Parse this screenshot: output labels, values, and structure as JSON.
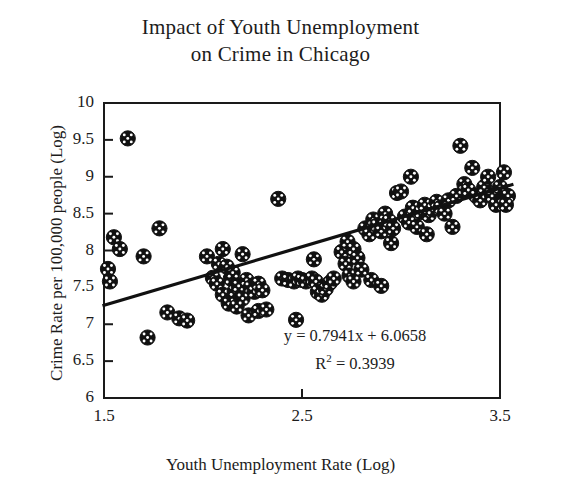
{
  "chart_data": {
    "type": "scatter",
    "title": "Impact of Youth Unemployment\non Crime in Chicago",
    "title_line1": "Impact of Youth Unemployment",
    "title_line2": "on Crime in Chicago",
    "xlabel": "Youth Unemployment Rate (Log)",
    "ylabel": "Crime Rate per 100,000 people (Log)",
    "xlim": [
      1.5,
      3.5
    ],
    "ylim": [
      6,
      10
    ],
    "xticks": [
      1.5,
      2.5,
      3.5
    ],
    "xtick_labels": [
      "1.5",
      "2.5",
      "3.5"
    ],
    "yticks": [
      6,
      6.5,
      7,
      7.5,
      8,
      8.5,
      9,
      9.5,
      10
    ],
    "ytick_labels": [
      "6",
      "6.5",
      "7",
      "7.5",
      "8",
      "8.5",
      "9",
      "9.5",
      "10"
    ],
    "grid": false,
    "legend": null,
    "marker": "circle-with-white-cross-speckle",
    "marker_color": "#111111",
    "series": [
      {
        "name": "Chicago community areas",
        "points": [
          [
            1.52,
            7.75
          ],
          [
            1.55,
            8.18
          ],
          [
            1.58,
            8.02
          ],
          [
            1.53,
            7.58
          ],
          [
            1.62,
            9.52
          ],
          [
            1.7,
            7.92
          ],
          [
            1.72,
            6.82
          ],
          [
            1.78,
            8.3
          ],
          [
            1.82,
            7.16
          ],
          [
            1.88,
            7.08
          ],
          [
            1.92,
            7.05
          ],
          [
            2.02,
            7.92
          ],
          [
            2.05,
            7.63
          ],
          [
            2.07,
            7.55
          ],
          [
            2.1,
            7.4
          ],
          [
            2.08,
            7.82
          ],
          [
            2.12,
            7.78
          ],
          [
            2.1,
            8.02
          ],
          [
            2.14,
            7.62
          ],
          [
            2.16,
            7.45
          ],
          [
            2.15,
            7.7
          ],
          [
            2.18,
            7.52
          ],
          [
            2.2,
            7.35
          ],
          [
            2.13,
            7.28
          ],
          [
            2.17,
            7.24
          ],
          [
            2.22,
            7.6
          ],
          [
            2.24,
            7.5
          ],
          [
            2.26,
            7.44
          ],
          [
            2.2,
            7.95
          ],
          [
            2.28,
            7.55
          ],
          [
            2.23,
            7.12
          ],
          [
            2.28,
            7.18
          ],
          [
            2.32,
            7.2
          ],
          [
            2.3,
            7.46
          ],
          [
            2.38,
            8.7
          ],
          [
            2.4,
            7.62
          ],
          [
            2.43,
            7.6
          ],
          [
            2.46,
            7.58
          ],
          [
            2.48,
            7.62
          ],
          [
            2.5,
            7.6
          ],
          [
            2.52,
            7.58
          ],
          [
            2.47,
            7.06
          ],
          [
            2.55,
            7.62
          ],
          [
            2.57,
            7.58
          ],
          [
            2.58,
            7.44
          ],
          [
            2.6,
            7.4
          ],
          [
            2.62,
            7.48
          ],
          [
            2.56,
            7.88
          ],
          [
            2.64,
            7.56
          ],
          [
            2.66,
            7.62
          ],
          [
            2.7,
            7.98
          ],
          [
            2.72,
            7.82
          ],
          [
            2.74,
            7.66
          ],
          [
            2.76,
            7.58
          ],
          [
            2.73,
            8.12
          ],
          [
            2.76,
            8.02
          ],
          [
            2.78,
            7.9
          ],
          [
            2.8,
            7.74
          ],
          [
            2.82,
            8.3
          ],
          [
            2.84,
            8.22
          ],
          [
            2.86,
            8.42
          ],
          [
            2.88,
            8.34
          ],
          [
            2.9,
            8.26
          ],
          [
            2.92,
            8.5
          ],
          [
            2.94,
            8.4
          ],
          [
            2.96,
            8.3
          ],
          [
            2.85,
            7.6
          ],
          [
            2.9,
            7.52
          ],
          [
            2.95,
            8.1
          ],
          [
            2.98,
            8.78
          ],
          [
            3.0,
            8.8
          ],
          [
            3.02,
            8.46
          ],
          [
            3.04,
            8.38
          ],
          [
            3.06,
            8.58
          ],
          [
            3.08,
            8.32
          ],
          [
            3.05,
            9.0
          ],
          [
            3.1,
            8.52
          ],
          [
            3.12,
            8.62
          ],
          [
            3.14,
            8.48
          ],
          [
            3.16,
            8.56
          ],
          [
            3.18,
            8.66
          ],
          [
            3.13,
            8.22
          ],
          [
            3.2,
            8.58
          ],
          [
            3.22,
            8.5
          ],
          [
            3.24,
            8.68
          ],
          [
            3.26,
            8.32
          ],
          [
            3.28,
            8.74
          ],
          [
            3.3,
            9.42
          ],
          [
            3.32,
            8.9
          ],
          [
            3.34,
            8.82
          ],
          [
            3.36,
            9.12
          ],
          [
            3.38,
            8.74
          ],
          [
            3.4,
            8.68
          ],
          [
            3.42,
            8.86
          ],
          [
            3.44,
            9.0
          ],
          [
            3.46,
            8.74
          ],
          [
            3.48,
            8.62
          ],
          [
            3.5,
            8.86
          ],
          [
            3.52,
            9.06
          ],
          [
            3.54,
            8.74
          ],
          [
            3.53,
            8.62
          ]
        ]
      }
    ],
    "trendline": {
      "equation": "y = 0.7941x + 6.0658",
      "slope": 0.7941,
      "intercept": 6.0658,
      "r_squared_label": "R",
      "r_squared_exponent": "2",
      "r_squared_value": "= 0.3939",
      "r_squared": 0.3939,
      "x_start": 1.5,
      "x_end": 3.56
    }
  }
}
